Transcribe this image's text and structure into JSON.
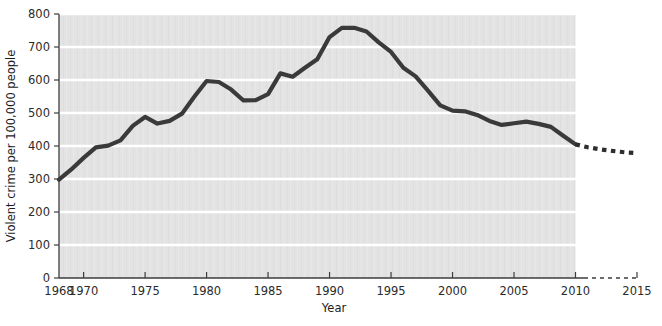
{
  "chart_data": {
    "type": "line",
    "title": "",
    "subtitle": "",
    "xlabel": "Year",
    "ylabel": "Violent crime per 100,000 people",
    "xlim": [
      1968,
      2015
    ],
    "ylim": [
      0,
      800
    ],
    "grid": true,
    "grid_axis": "y",
    "legend": "none",
    "x_ticks": [
      1968,
      1970,
      1975,
      1980,
      1985,
      1990,
      1995,
      2000,
      2005,
      2010,
      2015
    ],
    "x_tick_labels": [
      "1968",
      "1970",
      "1975",
      "1980",
      "1985",
      "1990",
      "1995",
      "2000",
      "2005",
      "2010",
      "2015"
    ],
    "y_ticks": [
      0,
      100,
      200,
      300,
      400,
      500,
      600,
      700,
      800
    ],
    "y_tick_labels": [
      "0",
      "100",
      "200",
      "300",
      "400",
      "500",
      "600",
      "700",
      "800"
    ],
    "annotations": [
      "Solid line: observed violent crime rate, 1968-2010",
      "Dashed line: projected violent crime rate, 2010-2015"
    ],
    "series": [
      {
        "name": "Violent crime rate (observed)",
        "style": "solid",
        "color": "#3a3a3a",
        "x": [
          1968,
          1969,
          1970,
          1971,
          1972,
          1973,
          1974,
          1975,
          1976,
          1977,
          1978,
          1979,
          1980,
          1981,
          1982,
          1983,
          1984,
          1985,
          1986,
          1987,
          1988,
          1989,
          1990,
          1991,
          1992,
          1993,
          1994,
          1995,
          1996,
          1997,
          1998,
          1999,
          2000,
          2001,
          2002,
          2003,
          2004,
          2005,
          2006,
          2007,
          2008,
          2009,
          2010
        ],
        "values": [
          298,
          329,
          364,
          396,
          401,
          417,
          461,
          488,
          468,
          476,
          498,
          549,
          597,
          594,
          571,
          538,
          539,
          557,
          620,
          610,
          637,
          663,
          730,
          758,
          758,
          747,
          714,
          685,
          637,
          611,
          568,
          523,
          507,
          505,
          494,
          476,
          464,
          469,
          474,
          467,
          458,
          431,
          405
        ]
      },
      {
        "name": "Violent crime rate (projected)",
        "style": "dashed",
        "color": "#2e2e2e",
        "x": [
          2010,
          2011,
          2012,
          2013,
          2014,
          2015
        ],
        "values": [
          405,
          396,
          390,
          385,
          381,
          378
        ]
      }
    ],
    "colors": {
      "plot_background": "#e3e3e3",
      "gridline": "#ffffff",
      "axis": "#3d3d3d",
      "line_observed": "#3a3a3a",
      "line_projected": "#2e2e2e",
      "text": "#2b2b2b",
      "page_background": "#ffffff"
    }
  }
}
